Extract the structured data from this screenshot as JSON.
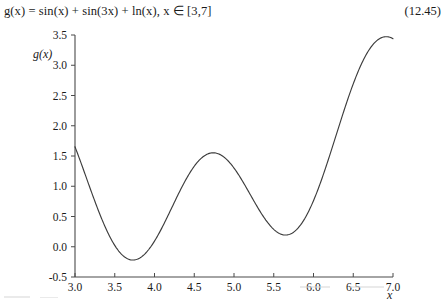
{
  "equation": {
    "text": "g(x) = sin(x) + sin(3x) + ln(x), x ∈ [3,7]",
    "number": "(12.45)"
  },
  "chart_data": {
    "type": "line",
    "title": "",
    "function": "g(x) = sin(x) + sin(3x) + ln(x)",
    "domain": "x ∈ [3,7]",
    "xlabel": "x",
    "ylabel": "g(x)",
    "xlim": [
      3.0,
      7.0
    ],
    "ylim": [
      -0.5,
      3.5
    ],
    "grid": false,
    "legend": "none",
    "xticks": [
      "3.0",
      "3.5",
      "4.0",
      "4.5",
      "5.0",
      "5.5",
      "6.0",
      "6.5",
      "7.0"
    ],
    "xtick_values": [
      3.0,
      3.5,
      4.0,
      4.5,
      5.0,
      5.5,
      6.0,
      6.5,
      7.0
    ],
    "yticks": [
      "-0.5",
      "0.0",
      "0.5",
      "1.0",
      "1.5",
      "2.0",
      "2.5",
      "3.0",
      "3.5"
    ],
    "ytick_values": [
      -0.5,
      0.0,
      0.5,
      1.0,
      1.5,
      2.0,
      2.5,
      3.0,
      3.5
    ],
    "series": [
      {
        "name": "g(x)",
        "color": "#3c3c3c",
        "x": [
          3.0,
          3.1,
          3.2,
          3.3,
          3.4,
          3.5,
          3.6,
          3.7,
          3.8,
          3.9,
          4.0,
          4.1,
          4.2,
          4.3,
          4.4,
          4.5,
          4.6,
          4.7,
          4.8,
          4.9,
          5.0,
          5.1,
          5.2,
          5.3,
          5.4,
          5.5,
          5.6,
          5.7,
          5.8,
          5.9,
          6.0,
          6.1,
          6.2,
          6.3,
          6.4,
          6.5,
          6.6,
          6.7,
          6.8,
          6.9,
          7.0
        ],
        "y": [
          1.652,
          1.277,
          0.919,
          0.613,
          0.383,
          0.239,
          0.177,
          0.18,
          0.228,
          0.298,
          0.375,
          0.451,
          0.528,
          0.614,
          0.72,
          0.856,
          1.024,
          1.216,
          1.409,
          1.575,
          1.684,
          1.713,
          1.65,
          1.501,
          1.292,
          1.061,
          0.851,
          0.7,
          0.631,
          0.652,
          0.755,
          0.922,
          1.128,
          1.348,
          1.563,
          1.761,
          1.938,
          2.093,
          2.23,
          2.35,
          2.453
        ],
        "key_points": [
          {
            "label": "start",
            "x": 3.0,
            "y": 1.65
          },
          {
            "label": "global-min",
            "x": 3.74,
            "y": -0.24
          },
          {
            "label": "local-max",
            "x": 4.76,
            "y": 1.51
          },
          {
            "label": "local-min",
            "x": 5.67,
            "y": 0.17
          },
          {
            "label": "max-near-end",
            "x": 6.93,
            "y": 3.42
          },
          {
            "label": "end",
            "x": 7.0,
            "y": 3.4
          }
        ]
      }
    ]
  }
}
